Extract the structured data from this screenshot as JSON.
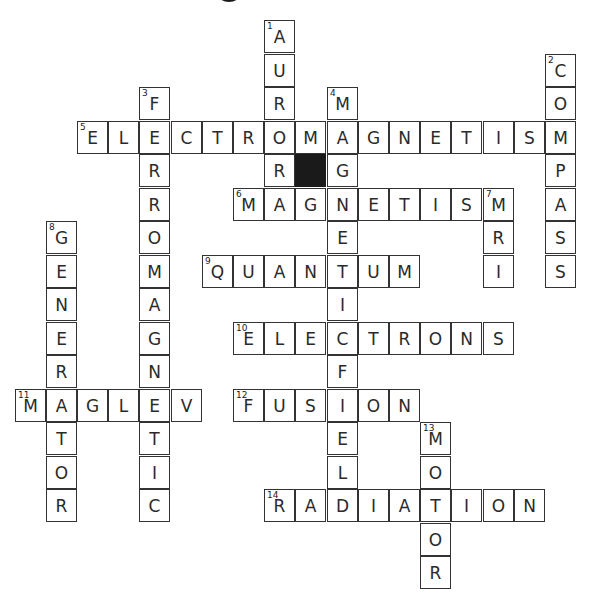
{
  "puzzle": {
    "grid": {
      "origin_x": 14.6,
      "origin_y": 20,
      "cell_w": 31.2,
      "cell_h": 33.5
    },
    "block_cells": [
      {
        "col": 9,
        "row": 4
      }
    ],
    "entries": [
      {
        "number": 1,
        "direction": "down",
        "answer": "AURORA",
        "col": 8,
        "row": 0
      },
      {
        "number": 2,
        "direction": "down",
        "answer": "COMPASS",
        "col": 17,
        "row": 1
      },
      {
        "number": 3,
        "direction": "down",
        "answer": "FERROMAGNETIC",
        "col": 4,
        "row": 2
      },
      {
        "number": 4,
        "direction": "down",
        "answer": "MAGNETICFIELD",
        "col": 10,
        "row": 2
      },
      {
        "number": 5,
        "direction": "across",
        "answer": "ELECTROMAGNETISM",
        "col": 2,
        "row": 3
      },
      {
        "number": 6,
        "direction": "across",
        "answer": "MAGNETISM",
        "col": 7,
        "row": 5
      },
      {
        "number": 7,
        "direction": "down",
        "answer": "MRI",
        "col": 15,
        "row": 5
      },
      {
        "number": 8,
        "direction": "down",
        "answer": "GENERATOR",
        "col": 1,
        "row": 6
      },
      {
        "number": 9,
        "direction": "across",
        "answer": "QUANTUM",
        "col": 6,
        "row": 7
      },
      {
        "number": 10,
        "direction": "across",
        "answer": "ELECTRONS",
        "col": 7,
        "row": 9
      },
      {
        "number": 11,
        "direction": "across",
        "answer": "MAGLEV",
        "col": 0,
        "row": 11
      },
      {
        "number": 12,
        "direction": "across",
        "answer": "FUSION",
        "col": 7,
        "row": 11
      },
      {
        "number": 13,
        "direction": "down",
        "answer": "MOTOR",
        "col": 13,
        "row": 12
      },
      {
        "number": 14,
        "direction": "across",
        "answer": "RADIATION",
        "col": 8,
        "row": 14
      }
    ]
  },
  "colors": {
    "border": "#333333",
    "block": "#1a1a1a",
    "text": "#2a2a2a"
  }
}
